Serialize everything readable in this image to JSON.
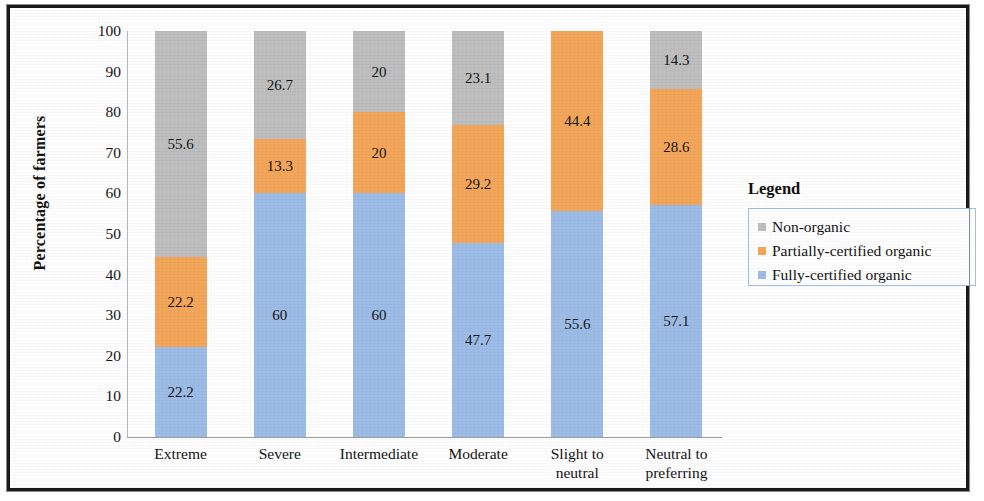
{
  "chart_data": {
    "type": "bar",
    "subtype": "stacked-bar-100",
    "title": "",
    "xlabel": "",
    "ylabel": "Percentage of farmers",
    "ylim": [
      0,
      100
    ],
    "ytick_step": 10,
    "yticks": [
      "100",
      "90",
      "80",
      "70",
      "60",
      "50",
      "40",
      "30",
      "20",
      "10",
      "0"
    ],
    "grid": false,
    "legend_position": "right",
    "legend_title": "Legend",
    "categories": [
      "Extreme",
      "Severe",
      "Intermediate",
      "Moderate",
      "Slight to neutral",
      "Neutral to preferring"
    ],
    "category_lines": [
      [
        "Extreme"
      ],
      [
        "Severe"
      ],
      [
        "Intermediate"
      ],
      [
        "Moderate"
      ],
      [
        "Slight to",
        "neutral"
      ],
      [
        "Neutral to",
        "preferring"
      ]
    ],
    "series": [
      {
        "name": "Fully-certified organic",
        "color": "#9dbde8",
        "values": [
          22.2,
          60,
          60,
          47.7,
          55.6,
          57.1
        ],
        "labels": [
          "22.2",
          "60",
          "60",
          "47.7",
          "55.6",
          "57.1"
        ]
      },
      {
        "name": "Partially-certified organic",
        "color": "#f4a75b",
        "values": [
          22.2,
          13.3,
          20,
          29.2,
          44.4,
          28.6
        ],
        "labels": [
          "22.2",
          "13.3",
          "20",
          "29.2",
          "44.4",
          "28.6"
        ]
      },
      {
        "name": "Non-organic",
        "color": "#bfbfbf",
        "values": [
          55.6,
          26.7,
          20,
          23.1,
          0,
          14.3
        ],
        "labels": [
          "55.6",
          "26.7",
          "20",
          "23.1",
          "",
          "14.3"
        ]
      }
    ],
    "legend_entries": [
      {
        "label": "Non-organic",
        "color": "#bfbfbf"
      },
      {
        "label": "Partially-certified organic",
        "color": "#f4a75b"
      },
      {
        "label": "Fully-certified organic",
        "color": "#9dbde8"
      }
    ]
  }
}
